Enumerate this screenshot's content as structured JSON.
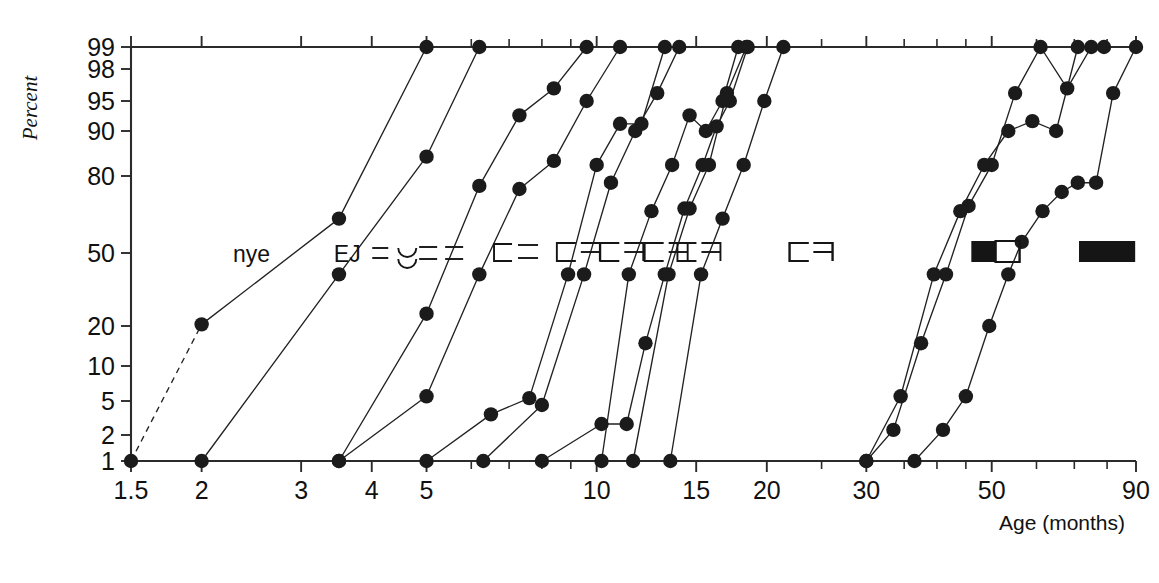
{
  "figure": {
    "percent_axis_title": "Percent",
    "age_axis_title": "Age (months)"
  },
  "chart_data": {
    "type": "line",
    "title": "",
    "subtitle": "",
    "xlabel": "Age (months)",
    "ylabel": "Percent",
    "xscale": "log",
    "yscale": "probit",
    "grid": false,
    "legend": "inline-labels-at-50-percent",
    "xlim": [
      1.5,
      90
    ],
    "ylim": [
      1,
      99
    ],
    "xticks": [
      1.5,
      2,
      3,
      4,
      5,
      10,
      15,
      20,
      30,
      50,
      90
    ],
    "xtick_labels": [
      "1.5",
      "2",
      "3",
      "4",
      "5",
      "10",
      "15",
      "20",
      "30",
      "50",
      "90"
    ],
    "xticks_minor": [
      6,
      7,
      8,
      9,
      25,
      35,
      40,
      45,
      60,
      70,
      80
    ],
    "yticks": [
      1,
      2,
      5,
      10,
      20,
      50,
      80,
      90,
      95,
      98,
      99
    ],
    "ytick_labels": [
      "1",
      "2",
      "5",
      "10",
      "20",
      "50",
      "80",
      "90",
      "95",
      "98",
      "99"
    ],
    "series": [
      {
        "name": "nye",
        "label": "nye",
        "label_x": 2.45,
        "dashed_lead": true,
        "points": [
          {
            "x": 1.5,
            "y": 1
          },
          {
            "x": 2.0,
            "y": 20.5
          },
          {
            "x": 3.5,
            "y": 65
          },
          {
            "x": 5.0,
            "y": 99
          }
        ]
      },
      {
        "name": "EJ",
        "label": "EJ",
        "label_x": 3.62,
        "dashed_lead": false,
        "points": [
          {
            "x": 2.0,
            "y": 1
          },
          {
            "x": 3.5,
            "y": 40
          },
          {
            "x": 5.0,
            "y": 85
          },
          {
            "x": 6.2,
            "y": 99
          }
        ]
      },
      {
        "name": "series-3",
        "label": "tofu-2-narrow",
        "label_x": 4.42,
        "dashed_lead": false,
        "points": [
          {
            "x": 3.5,
            "y": 1
          },
          {
            "x": 5.0,
            "y": 24
          },
          {
            "x": 6.2,
            "y": 77
          },
          {
            "x": 7.3,
            "y": 93
          },
          {
            "x": 8.4,
            "y": 96.5
          },
          {
            "x": 9.6,
            "y": 99
          }
        ]
      },
      {
        "name": "series-4",
        "label": "tofu-2-dash",
        "label_x": 5.35,
        "dashed_lead": false,
        "points": [
          {
            "x": 3.5,
            "y": 1
          },
          {
            "x": 5.0,
            "y": 5.5
          },
          {
            "x": 6.2,
            "y": 40
          },
          {
            "x": 7.3,
            "y": 76
          },
          {
            "x": 8.4,
            "y": 84
          },
          {
            "x": 9.6,
            "y": 95
          },
          {
            "x": 11.0,
            "y": 99
          }
        ]
      },
      {
        "name": "series-5",
        "label": "tofu-2-wide",
        "label_x": 7.2,
        "dashed_lead": false,
        "points": [
          {
            "x": 5.0,
            "y": 1
          },
          {
            "x": 6.5,
            "y": 3.5
          },
          {
            "x": 7.6,
            "y": 5.3
          },
          {
            "x": 8.9,
            "y": 40
          },
          {
            "x": 10.0,
            "y": 83
          },
          {
            "x": 11.0,
            "y": 91.5
          },
          {
            "x": 12.0,
            "y": 91.5
          },
          {
            "x": 13.2,
            "y": 99
          }
        ]
      },
      {
        "name": "series-6",
        "label": "tofu-box-1",
        "label_x": 9.3,
        "dashed_lead": false,
        "points": [
          {
            "x": 6.3,
            "y": 1
          },
          {
            "x": 8.0,
            "y": 4.5
          },
          {
            "x": 9.5,
            "y": 40
          },
          {
            "x": 10.6,
            "y": 78
          },
          {
            "x": 11.7,
            "y": 90
          },
          {
            "x": 12.8,
            "y": 96
          },
          {
            "x": 14.0,
            "y": 99
          }
        ]
      },
      {
        "name": "series-7",
        "label": "tofu-box-2",
        "label_x": 11.1,
        "dashed_lead": false,
        "points": [
          {
            "x": 8.0,
            "y": 1
          },
          {
            "x": 10.2,
            "y": 2.7
          },
          {
            "x": 11.3,
            "y": 2.7
          },
          {
            "x": 12.2,
            "y": 15
          },
          {
            "x": 13.2,
            "y": 40
          },
          {
            "x": 14.3,
            "y": 69
          },
          {
            "x": 15.4,
            "y": 83
          },
          {
            "x": 16.3,
            "y": 91
          },
          {
            "x": 17.2,
            "y": 95
          },
          {
            "x": 18.5,
            "y": 99
          }
        ]
      },
      {
        "name": "series-8",
        "label": "tofu-box-3",
        "label_x": 13.3,
        "dashed_lead": false,
        "points": [
          {
            "x": 10.2,
            "y": 1
          },
          {
            "x": 11.4,
            "y": 40
          },
          {
            "x": 12.5,
            "y": 68
          },
          {
            "x": 13.6,
            "y": 83
          },
          {
            "x": 14.6,
            "y": 93
          },
          {
            "x": 15.6,
            "y": 90
          },
          {
            "x": 16.7,
            "y": 95
          },
          {
            "x": 17.8,
            "y": 99
          }
        ]
      },
      {
        "name": "series-9",
        "label": "tofu-box-4",
        "label_x": 15.2,
        "dashed_lead": false,
        "points": [
          {
            "x": 11.6,
            "y": 1
          },
          {
            "x": 13.4,
            "y": 40
          },
          {
            "x": 14.6,
            "y": 69
          },
          {
            "x": 15.8,
            "y": 83
          },
          {
            "x": 17.0,
            "y": 96
          },
          {
            "x": 18.4,
            "y": 99
          }
        ]
      },
      {
        "name": "series-10",
        "label": "tofu-box-wide",
        "label_x": 24.0,
        "dashed_lead": false,
        "points": [
          {
            "x": 13.5,
            "y": 1
          },
          {
            "x": 15.3,
            "y": 40
          },
          {
            "x": 16.7,
            "y": 65
          },
          {
            "x": 18.2,
            "y": 83
          },
          {
            "x": 19.8,
            "y": 95
          },
          {
            "x": 21.4,
            "y": 99
          }
        ]
      },
      {
        "name": "series-11",
        "label": "tofu-half-filled",
        "label_x": 51.0,
        "dashed_lead": false,
        "points": [
          {
            "x": 30.0,
            "y": 1
          },
          {
            "x": 33.5,
            "y": 2.3
          },
          {
            "x": 37.5,
            "y": 15
          },
          {
            "x": 41.5,
            "y": 40
          },
          {
            "x": 45.5,
            "y": 70
          },
          {
            "x": 50.0,
            "y": 83
          },
          {
            "x": 55.0,
            "y": 96
          },
          {
            "x": 61.0,
            "y": 99
          },
          {
            "x": 68.0,
            "y": 96.5
          },
          {
            "x": 75.0,
            "y": 99
          }
        ]
      },
      {
        "name": "series-12",
        "label": "tofu-filled",
        "label_x": 80.0,
        "dashed_lead": false,
        "points": [
          {
            "x": 30.0,
            "y": 1
          },
          {
            "x": 34.5,
            "y": 5.5
          },
          {
            "x": 39.5,
            "y": 40
          },
          {
            "x": 44.0,
            "y": 68
          },
          {
            "x": 48.5,
            "y": 83
          },
          {
            "x": 53.5,
            "y": 90
          },
          {
            "x": 59.0,
            "y": 92
          },
          {
            "x": 65.0,
            "y": 90
          },
          {
            "x": 71.0,
            "y": 99
          },
          {
            "x": 79.0,
            "y": 99
          }
        ]
      },
      {
        "name": "series-13",
        "label": "",
        "label_x": 0,
        "dashed_lead": false,
        "points": [
          {
            "x": 36.5,
            "y": 1
          },
          {
            "x": 41.0,
            "y": 2.3
          },
          {
            "x": 45.0,
            "y": 5.5
          },
          {
            "x": 49.5,
            "y": 20
          },
          {
            "x": 53.5,
            "y": 40
          },
          {
            "x": 56.5,
            "y": 55
          },
          {
            "x": 61.5,
            "y": 68
          },
          {
            "x": 66.5,
            "y": 75
          },
          {
            "x": 71.0,
            "y": 78
          },
          {
            "x": 76.5,
            "y": 78
          },
          {
            "x": 82.0,
            "y": 96
          },
          {
            "x": 90.0,
            "y": 99
          }
        ]
      }
    ]
  }
}
